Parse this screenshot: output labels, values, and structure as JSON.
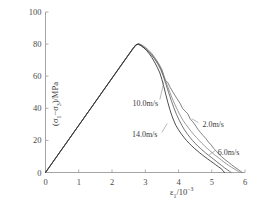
{
  "chart_data": {
    "type": "line",
    "title": "",
    "xlabel": "ε₁/10⁻³",
    "ylabel": "(σ₁−σ₃)/MPa",
    "xlim": [
      0,
      6
    ],
    "ylim": [
      0,
      100
    ],
    "xticks": [
      "0",
      "1",
      "2",
      "3",
      "4",
      "5",
      "6"
    ],
    "yticks": [
      "0",
      "20",
      "40",
      "60",
      "80",
      "100"
    ],
    "xtick_values": [
      0,
      1,
      2,
      3,
      4,
      5,
      6
    ],
    "ytick_values": [
      0,
      20,
      40,
      60,
      80,
      100
    ],
    "grid": false,
    "legend_position": "inline-annotations",
    "annotations": [
      {
        "label": "10.0m/s",
        "x": 2.62,
        "y": 43.0
      },
      {
        "label": "14.0m/s",
        "x": 2.6,
        "y": 23.5
      },
      {
        "label": "2.0m/s",
        "x": 4.72,
        "y": 29.5
      },
      {
        "label": "6.0m/s",
        "x": 5.18,
        "y": 12.0
      }
    ],
    "series": [
      {
        "name": "2.0m/s",
        "color": "#6b6b6b",
        "points": [
          [
            0.0,
            0.0
          ],
          [
            0.3,
            8.8
          ],
          [
            0.6,
            17.6
          ],
          [
            0.9,
            26.4
          ],
          [
            1.2,
            35.2
          ],
          [
            1.5,
            44.0
          ],
          [
            1.8,
            52.8
          ],
          [
            2.1,
            61.6
          ],
          [
            2.4,
            70.4
          ],
          [
            2.6,
            76.2
          ],
          [
            2.72,
            79.6
          ],
          [
            2.8,
            80.2
          ],
          [
            2.9,
            79.4
          ],
          [
            3.0,
            78.0
          ],
          [
            3.1,
            76.2
          ],
          [
            3.2,
            74.0
          ],
          [
            3.3,
            71.2
          ],
          [
            3.4,
            68.0
          ],
          [
            3.5,
            64.2
          ],
          [
            3.55,
            61.0
          ],
          [
            3.6,
            57.5
          ],
          [
            3.68,
            56.0
          ],
          [
            3.75,
            53.0
          ],
          [
            3.85,
            49.5
          ],
          [
            3.95,
            46.2
          ],
          [
            4.05,
            43.0
          ],
          [
            4.12,
            40.0
          ],
          [
            4.2,
            38.2
          ],
          [
            4.28,
            36.6
          ],
          [
            4.35,
            33.4
          ],
          [
            4.42,
            31.8
          ],
          [
            4.5,
            29.6
          ],
          [
            4.58,
            27.0
          ],
          [
            4.66,
            25.0
          ],
          [
            4.74,
            23.0
          ],
          [
            4.82,
            21.2
          ],
          [
            4.9,
            19.0
          ],
          [
            4.98,
            17.2
          ],
          [
            5.06,
            15.0
          ],
          [
            5.14,
            13.2
          ],
          [
            5.22,
            11.4
          ],
          [
            5.3,
            9.8
          ],
          [
            5.4,
            8.0
          ],
          [
            5.5,
            6.4
          ],
          [
            5.6,
            4.8
          ],
          [
            5.7,
            3.2
          ],
          [
            5.8,
            1.8
          ],
          [
            5.88,
            0.6
          ],
          [
            5.92,
            0.0
          ]
        ]
      },
      {
        "name": "6.0m/s",
        "color": "#8a8a8a",
        "points": [
          [
            0.0,
            0.0
          ],
          [
            0.35,
            10.3
          ],
          [
            0.7,
            20.5
          ],
          [
            1.05,
            30.8
          ],
          [
            1.4,
            41.0
          ],
          [
            1.75,
            51.3
          ],
          [
            2.1,
            61.5
          ],
          [
            2.45,
            71.8
          ],
          [
            2.65,
            77.5
          ],
          [
            2.74,
            79.8
          ],
          [
            2.82,
            80.0
          ],
          [
            2.92,
            78.8
          ],
          [
            3.02,
            77.2
          ],
          [
            3.12,
            75.2
          ],
          [
            3.22,
            72.8
          ],
          [
            3.32,
            70.0
          ],
          [
            3.42,
            66.6
          ],
          [
            3.5,
            63.2
          ],
          [
            3.58,
            59.0
          ],
          [
            3.66,
            54.4
          ],
          [
            3.74,
            50.0
          ],
          [
            3.82,
            45.8
          ],
          [
            3.9,
            42.0
          ],
          [
            3.98,
            38.5
          ],
          [
            4.06,
            35.2
          ],
          [
            4.14,
            32.4
          ],
          [
            4.22,
            30.0
          ],
          [
            4.3,
            27.8
          ],
          [
            4.38,
            25.6
          ],
          [
            4.46,
            23.6
          ],
          [
            4.54,
            21.8
          ],
          [
            4.62,
            20.0
          ],
          [
            4.7,
            18.3
          ],
          [
            4.78,
            16.7
          ],
          [
            4.86,
            15.1
          ],
          [
            4.94,
            13.6
          ],
          [
            5.02,
            12.2
          ],
          [
            5.1,
            10.8
          ],
          [
            5.2,
            9.2
          ],
          [
            5.3,
            7.6
          ],
          [
            5.4,
            6.0
          ],
          [
            5.5,
            4.6
          ],
          [
            5.6,
            3.2
          ],
          [
            5.7,
            1.9
          ],
          [
            5.8,
            0.8
          ],
          [
            5.86,
            0.0
          ]
        ]
      },
      {
        "name": "10.0m/s",
        "color": "#5c5c5c",
        "points": [
          [
            0.0,
            0.0
          ],
          [
            0.32,
            9.4
          ],
          [
            0.64,
            18.8
          ],
          [
            0.96,
            28.2
          ],
          [
            1.28,
            37.6
          ],
          [
            1.6,
            47.0
          ],
          [
            1.92,
            56.4
          ],
          [
            2.24,
            65.8
          ],
          [
            2.56,
            75.2
          ],
          [
            2.7,
            79.2
          ],
          [
            2.78,
            79.9
          ],
          [
            2.88,
            78.9
          ],
          [
            2.98,
            77.4
          ],
          [
            3.08,
            75.6
          ],
          [
            3.18,
            73.4
          ],
          [
            3.28,
            70.8
          ],
          [
            3.38,
            67.6
          ],
          [
            3.46,
            64.4
          ],
          [
            3.54,
            60.2
          ],
          [
            3.62,
            55.2
          ],
          [
            3.7,
            50.0
          ],
          [
            3.78,
            45.0
          ],
          [
            3.86,
            40.4
          ],
          [
            3.94,
            36.2
          ],
          [
            4.02,
            32.6
          ],
          [
            4.1,
            29.4
          ],
          [
            4.18,
            26.6
          ],
          [
            4.26,
            24.2
          ],
          [
            4.34,
            22.0
          ],
          [
            4.42,
            20.0
          ],
          [
            4.5,
            18.2
          ],
          [
            4.58,
            16.5
          ],
          [
            4.66,
            15.0
          ],
          [
            4.74,
            13.5
          ],
          [
            4.82,
            12.1
          ],
          [
            4.9,
            10.8
          ],
          [
            4.98,
            9.5
          ],
          [
            5.06,
            8.2
          ],
          [
            5.14,
            6.9
          ],
          [
            5.22,
            5.6
          ],
          [
            5.3,
            4.3
          ],
          [
            5.38,
            3.0
          ],
          [
            5.46,
            1.8
          ],
          [
            5.54,
            0.7
          ],
          [
            5.58,
            0.0
          ]
        ]
      },
      {
        "name": "14.0m/s",
        "color": "#2e2e2e",
        "points": [
          [
            0.0,
            0.0
          ],
          [
            0.34,
            10.0
          ],
          [
            0.68,
            20.0
          ],
          [
            1.02,
            30.0
          ],
          [
            1.36,
            40.0
          ],
          [
            1.7,
            50.0
          ],
          [
            2.04,
            60.0
          ],
          [
            2.38,
            70.0
          ],
          [
            2.62,
            77.0
          ],
          [
            2.72,
            79.5
          ],
          [
            2.8,
            80.0
          ],
          [
            2.88,
            79.0
          ],
          [
            2.96,
            77.6
          ],
          [
            3.04,
            76.0
          ],
          [
            3.12,
            74.0
          ],
          [
            3.2,
            71.6
          ],
          [
            3.28,
            68.8
          ],
          [
            3.36,
            65.6
          ],
          [
            3.44,
            62.0
          ],
          [
            3.5,
            58.0
          ],
          [
            3.56,
            53.4
          ],
          [
            3.62,
            48.4
          ],
          [
            3.68,
            43.6
          ],
          [
            3.74,
            39.2
          ],
          [
            3.8,
            35.4
          ],
          [
            3.86,
            32.2
          ],
          [
            3.92,
            29.4
          ],
          [
            4.0,
            26.6
          ],
          [
            4.08,
            24.2
          ],
          [
            4.16,
            22.0
          ],
          [
            4.24,
            20.0
          ],
          [
            4.32,
            18.2
          ],
          [
            4.4,
            16.6
          ],
          [
            4.48,
            15.0
          ],
          [
            4.56,
            13.6
          ],
          [
            4.64,
            12.2
          ],
          [
            4.72,
            10.9
          ],
          [
            4.8,
            9.6
          ],
          [
            4.88,
            8.4
          ],
          [
            4.96,
            7.2
          ],
          [
            5.04,
            6.0
          ],
          [
            5.12,
            4.8
          ],
          [
            5.2,
            3.6
          ],
          [
            5.28,
            2.4
          ],
          [
            5.34,
            1.2
          ],
          [
            5.38,
            0.0
          ]
        ]
      }
    ]
  },
  "axes": {
    "x_title": "ε₁/10⁻³",
    "y_title": "(σ₁−σ₃)/MPa"
  }
}
